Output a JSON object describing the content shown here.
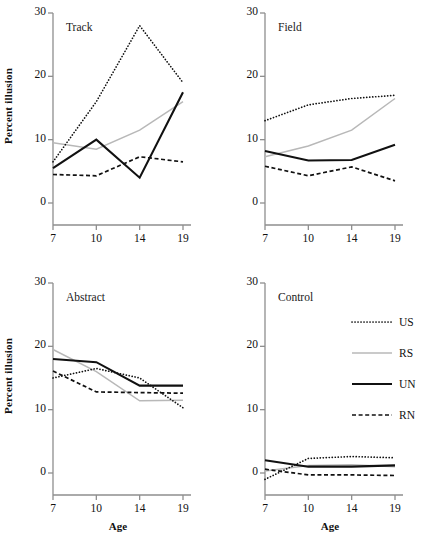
{
  "figure": {
    "ylabel": "Percent illusion",
    "xlabel": "Age",
    "yticks": [
      "0",
      "10",
      "20",
      "30"
    ],
    "xticks": [
      "7",
      "10",
      "14",
      "19"
    ]
  },
  "legend": {
    "items": [
      {
        "label": "US",
        "style": "dotted",
        "color": "#111111"
      },
      {
        "label": "RS",
        "style": "solid-gray",
        "color": "#b8b8b8"
      },
      {
        "label": "UN",
        "style": "solid",
        "color": "#111111"
      },
      {
        "label": "RN",
        "style": "dashed",
        "color": "#111111"
      }
    ]
  },
  "chart_data": [
    {
      "type": "line",
      "title": "Track",
      "xlabel": "Age",
      "ylabel": "Percent illusion",
      "x": [
        7,
        10,
        14,
        19
      ],
      "categories": [
        "7",
        "10",
        "14",
        "19"
      ],
      "ylim": [
        0,
        30
      ],
      "yticks": [
        0,
        10,
        20,
        30
      ],
      "grid": false,
      "series": [
        {
          "name": "US",
          "values": [
            6.5,
            16.0,
            28.0,
            19.0
          ]
        },
        {
          "name": "RS",
          "values": [
            9.5,
            8.5,
            11.5,
            16.0
          ]
        },
        {
          "name": "UN",
          "values": [
            5.5,
            10.0,
            4.0,
            17.5
          ]
        },
        {
          "name": "RN",
          "values": [
            4.5,
            4.3,
            7.3,
            6.5
          ]
        }
      ]
    },
    {
      "type": "line",
      "title": "Field",
      "xlabel": "Age",
      "ylabel": "Percent illusion",
      "x": [
        7,
        10,
        14,
        19
      ],
      "categories": [
        "7",
        "10",
        "14",
        "19"
      ],
      "ylim": [
        0,
        30
      ],
      "yticks": [
        0,
        10,
        20,
        30
      ],
      "grid": false,
      "series": [
        {
          "name": "US",
          "values": [
            13.0,
            15.5,
            16.5,
            17.0
          ]
        },
        {
          "name": "RS",
          "values": [
            7.3,
            9.0,
            11.5,
            16.5
          ]
        },
        {
          "name": "UN",
          "values": [
            8.2,
            6.7,
            6.8,
            9.2
          ]
        },
        {
          "name": "RN",
          "values": [
            5.8,
            4.3,
            5.7,
            3.5
          ]
        }
      ]
    },
    {
      "type": "line",
      "title": "Abstract",
      "xlabel": "Age",
      "ylabel": "Percent illusion",
      "x": [
        7,
        10,
        14,
        19
      ],
      "categories": [
        "7",
        "10",
        "14",
        "19"
      ],
      "ylim": [
        0,
        30
      ],
      "yticks": [
        0,
        10,
        20,
        30
      ],
      "grid": false,
      "series": [
        {
          "name": "US",
          "values": [
            15.0,
            16.5,
            15.0,
            10.3
          ]
        },
        {
          "name": "RS",
          "values": [
            19.5,
            16.0,
            11.4,
            11.5
          ]
        },
        {
          "name": "UN",
          "values": [
            18.0,
            17.5,
            13.8,
            13.8
          ]
        },
        {
          "name": "RN",
          "values": [
            16.1,
            12.8,
            12.7,
            12.6
          ]
        }
      ]
    },
    {
      "type": "line",
      "title": "Control",
      "xlabel": "Age",
      "ylabel": "Percent illusion",
      "x": [
        7,
        10,
        14,
        19
      ],
      "categories": [
        "7",
        "10",
        "14",
        "19"
      ],
      "ylim": [
        0,
        30
      ],
      "yticks": [
        0,
        10,
        20,
        30
      ],
      "grid": false,
      "series": [
        {
          "name": "US",
          "values": [
            -1.0,
            2.3,
            2.6,
            2.4
          ]
        },
        {
          "name": "RS",
          "values": [
            0.3,
            1.2,
            1.3,
            1.0
          ]
        },
        {
          "name": "UN",
          "values": [
            2.0,
            1.0,
            1.0,
            1.2
          ]
        },
        {
          "name": "RN",
          "values": [
            0.6,
            -0.3,
            -0.3,
            -0.4
          ]
        }
      ]
    }
  ]
}
